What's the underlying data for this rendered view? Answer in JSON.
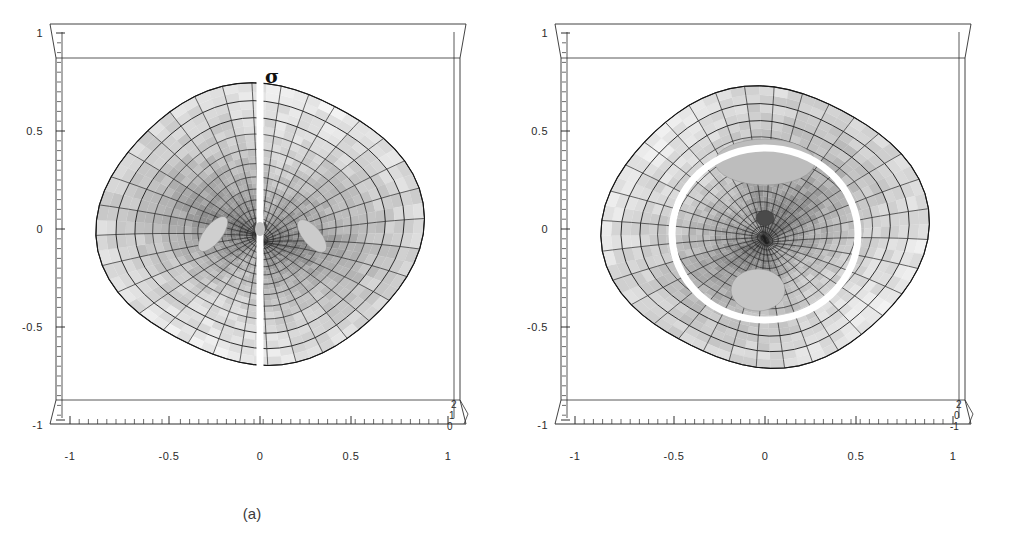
{
  "figure": {
    "caption_a": "(a)",
    "caption_b": "(b)",
    "background": "#ffffff"
  },
  "chart_data": [
    {
      "type": "surface",
      "panel": "a",
      "title": "",
      "xlabel": "",
      "ylabel": "",
      "zlabel": "",
      "xlim": [
        -1.15,
        1.15
      ],
      "ylim": [
        -1.15,
        1.15
      ],
      "zlim": [
        0,
        2
      ],
      "xticks": [
        -1,
        -0.5,
        0,
        0.5,
        1
      ],
      "xticklabels": [
        "-1",
        "-0.5",
        "0",
        "0.5",
        "1"
      ],
      "yticks": [
        -1,
        -0.5,
        0,
        0.5,
        1
      ],
      "yticklabels": [
        "-1",
        "-0.5",
        "0",
        "0.5",
        "1"
      ],
      "zticks": [
        0,
        1,
        2
      ],
      "zticklabels": [
        "0",
        "1",
        "2"
      ],
      "grid": true,
      "legend": "none",
      "annotations": [
        {
          "text": "σ",
          "x": 0.02,
          "y": 0.82,
          "desc": "branch-cut-label"
        }
      ],
      "description": "Grayscale polar-mesh Riemann surface viewed from above; a vertical white branch cut runs from the top edge through the central singularity to the bottom edge; two light wing-shaped patches flank the centre.",
      "features": {
        "mesh": "polar",
        "radial_lines": 32,
        "circular_lines": 16,
        "center_singularity": true,
        "white_cut": "vertical-line",
        "shading_min": "#3a3a3a",
        "shading_max": "#e4e4e4"
      }
    },
    {
      "type": "surface",
      "panel": "b",
      "title": "",
      "xlabel": "",
      "ylabel": "",
      "zlabel": "",
      "xlim": [
        -1.15,
        1.15
      ],
      "ylim": [
        -1.15,
        1.15
      ],
      "zlim": [
        -1,
        2
      ],
      "xticks": [
        -1,
        -0.5,
        0,
        0.5,
        1
      ],
      "xticklabels": [
        "-1",
        "-0.5",
        "0",
        "0.5",
        "1"
      ],
      "yticks": [
        -1,
        -0.5,
        0,
        0.5,
        1
      ],
      "yticklabels": [
        "-1",
        "-0.5",
        "0",
        "0.5",
        "1"
      ],
      "zticks": [
        -1,
        0,
        2
      ],
      "zticklabels": [
        "-1",
        "0",
        "2"
      ],
      "grid": true,
      "legend": "none",
      "annotations": [],
      "description": "Grayscale polar-mesh Riemann surface viewed from above; a closed white loop encircles the central singularity; a light elliptical patch sits above the loop and a second light patch inside its lower part.",
      "features": {
        "mesh": "polar",
        "radial_lines": 32,
        "circular_lines": 16,
        "center_singularity": true,
        "white_cut": "closed-loop",
        "shading_min": "#3a3a3a",
        "shading_max": "#e4e4e4"
      }
    }
  ],
  "panels": [
    {
      "id": "a",
      "caption": "(a)",
      "y_axis": {
        "name": "y-axis",
        "ticks": [
          "1",
          "0.5",
          "0",
          "-0.5",
          "-1"
        ],
        "positions": [
          1,
          0.5,
          0,
          -0.5,
          -1
        ]
      },
      "x_axis": {
        "name": "x-axis",
        "ticks": [
          "-1",
          "-0.5",
          "0",
          "0.5",
          "1"
        ],
        "positions": [
          -1,
          -0.5,
          0,
          0.5,
          1
        ]
      },
      "z_axis": {
        "name": "z-axis",
        "ticks": [
          "2",
          "1",
          "0"
        ]
      },
      "sigma_label": "σ"
    },
    {
      "id": "b",
      "caption": "(b)",
      "y_axis": {
        "name": "y-axis",
        "ticks": [
          "1",
          "0.5",
          "0",
          "-0.5",
          "-1"
        ],
        "positions": [
          1,
          0.5,
          0,
          -0.5,
          -1
        ]
      },
      "x_axis": {
        "name": "x-axis",
        "ticks": [
          "-1",
          "-0.5",
          "0",
          "0.5",
          "1"
        ],
        "positions": [
          -1,
          -0.5,
          0,
          0.5,
          1
        ]
      },
      "z_axis": {
        "name": "z-axis",
        "ticks": [
          "2",
          "0",
          "-1"
        ]
      },
      "sigma_label": ""
    }
  ]
}
